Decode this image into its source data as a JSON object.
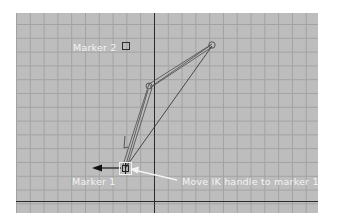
{
  "viewport": {
    "background_color": "#bdbdbd",
    "grid_color": "#a2a2a2",
    "axis_color": "#2a2a2a"
  },
  "labels": {
    "marker2": "Marker 2",
    "marker1": "Marker 1",
    "instruction": "Move IK handle to marker 1"
  },
  "scene": {
    "joints": [
      {
        "name": "shoulder",
        "x": 212,
        "y": 45
      },
      {
        "name": "elbow",
        "x": 149,
        "y": 86
      },
      {
        "name": "wrist-ik-handle",
        "x": 125,
        "y": 168
      }
    ],
    "marker2_box": {
      "x": 122,
      "y": 42,
      "size": 7
    },
    "ik_handle_box": {
      "x": 119,
      "y": 162,
      "size": 12
    }
  }
}
